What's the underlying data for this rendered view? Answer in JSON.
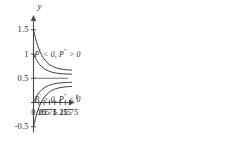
{
  "chart_data": {
    "type": "line",
    "title": "",
    "xlabel": "t",
    "ylabel": "y",
    "xlim": [
      -0.12,
      1.95
    ],
    "ylim": [
      -0.62,
      1.72
    ],
    "grid": false,
    "legend": null,
    "equilibrium": 0.5,
    "x_ticks": [
      {
        "value": 0.25,
        "label": "0.25"
      },
      {
        "value": 0.5,
        "label": "0.5"
      },
      {
        "value": 0.75,
        "label": "0.75"
      },
      {
        "value": 1,
        "label": "1"
      },
      {
        "value": 1.25,
        "label": "1.25"
      },
      {
        "value": 1.5,
        "label": "1.5"
      },
      {
        "value": 1.75,
        "label": "1.75"
      }
    ],
    "y_ticks": [
      {
        "value": 1.5,
        "label": "1.5"
      },
      {
        "value": 1,
        "label": "1"
      },
      {
        "value": 0.5,
        "label": "0.5"
      },
      {
        "value": -0.5,
        "label": "-0.5"
      }
    ],
    "series": [
      {
        "name": "solution-y0-1.5",
        "y0": 1.5,
        "points": [
          [
            0,
            1.5
          ],
          [
            0.1,
            1.313
          ],
          [
            0.2,
            1.168
          ],
          [
            0.3,
            1.055
          ],
          [
            0.4,
            0.966
          ],
          [
            0.5,
            0.897
          ],
          [
            0.6,
            0.844
          ],
          [
            0.7,
            0.802
          ],
          [
            0.8,
            0.77
          ],
          [
            0.9,
            0.745
          ],
          [
            1.0,
            0.725
          ],
          [
            1.1,
            0.71
          ],
          [
            1.2,
            0.699
          ],
          [
            1.3,
            0.69
          ],
          [
            1.4,
            0.683
          ],
          [
            1.5,
            0.678
          ],
          [
            1.6,
            0.674
          ],
          [
            1.7,
            0.671
          ],
          [
            1.8,
            0.668
          ]
        ]
      },
      {
        "name": "solution-y0-1.0",
        "y0": 1.0,
        "points": [
          [
            0,
            1.0
          ],
          [
            0.1,
            0.906
          ],
          [
            0.2,
            0.834
          ],
          [
            0.3,
            0.778
          ],
          [
            0.4,
            0.733
          ],
          [
            0.5,
            0.699
          ],
          [
            0.6,
            0.672
          ],
          [
            0.7,
            0.651
          ],
          [
            0.8,
            0.635
          ],
          [
            0.9,
            0.622
          ],
          [
            1.0,
            0.612
          ],
          [
            1.1,
            0.605
          ],
          [
            1.2,
            0.599
          ],
          [
            1.3,
            0.595
          ],
          [
            1.4,
            0.591
          ],
          [
            1.5,
            0.589
          ],
          [
            1.6,
            0.587
          ],
          [
            1.7,
            0.585
          ],
          [
            1.8,
            0.584
          ]
        ]
      },
      {
        "name": "solution-y0-0.0",
        "y0": 0.0,
        "points": [
          [
            0,
            0.0
          ],
          [
            0.1,
            0.094
          ],
          [
            0.2,
            0.166
          ],
          [
            0.3,
            0.222
          ],
          [
            0.4,
            0.267
          ],
          [
            0.5,
            0.301
          ],
          [
            0.6,
            0.328
          ],
          [
            0.7,
            0.349
          ],
          [
            0.8,
            0.365
          ],
          [
            0.9,
            0.378
          ],
          [
            1.0,
            0.388
          ],
          [
            1.1,
            0.395
          ],
          [
            1.2,
            0.401
          ],
          [
            1.3,
            0.405
          ],
          [
            1.4,
            0.409
          ],
          [
            1.5,
            0.411
          ],
          [
            1.6,
            0.413
          ],
          [
            1.7,
            0.415
          ],
          [
            1.8,
            0.416
          ]
        ]
      },
      {
        "name": "solution-y0--0.5",
        "y0": -0.5,
        "points": [
          [
            0,
            -0.5
          ],
          [
            0.1,
            -0.313
          ],
          [
            0.2,
            -0.168
          ],
          [
            0.3,
            -0.055
          ],
          [
            0.4,
            0.034
          ],
          [
            0.5,
            0.103
          ],
          [
            0.6,
            0.156
          ],
          [
            0.7,
            0.198
          ],
          [
            0.8,
            0.23
          ],
          [
            0.9,
            0.255
          ],
          [
            1.0,
            0.275
          ],
          [
            1.1,
            0.29
          ],
          [
            1.2,
            0.301
          ],
          [
            1.3,
            0.31
          ],
          [
            1.4,
            0.317
          ],
          [
            1.5,
            0.322
          ],
          [
            1.6,
            0.326
          ],
          [
            1.7,
            0.329
          ],
          [
            1.8,
            0.332
          ]
        ]
      }
    ],
    "annotations": [
      {
        "name": "region-above-equilibrium",
        "text_parts": {
          "lead": "P",
          "prime": "'",
          "mid": " < 0, P",
          "dprime": "\"",
          "tail": " > 0"
        },
        "x": 1.42,
        "y": 0.97
      },
      {
        "name": "region-below-equilibrium",
        "text_parts": {
          "lead": "P",
          "prime": "'",
          "mid": " > 0, P",
          "dprime": "\"",
          "tail": " < 0"
        },
        "x": 1.42,
        "y": 0.06
      }
    ],
    "colors": {
      "axis": "#4a4a4a",
      "curve": "#3a3a3a",
      "equilibrium": "#6e6e6e",
      "text": "#2b2b2b",
      "background": "#ffffff"
    }
  }
}
